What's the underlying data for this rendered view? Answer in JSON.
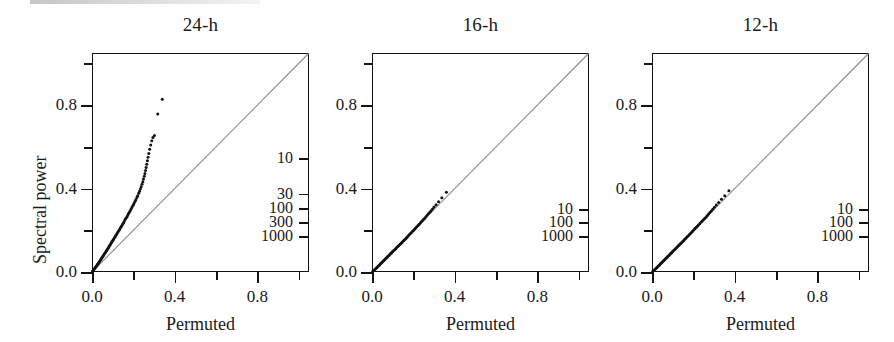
{
  "figure": {
    "axis_title_x": "Permuted",
    "axis_title_y": "Spectral power"
  },
  "chart_data": {
    "type": "scatter",
    "title": "",
    "xlabel": "Permuted",
    "ylabel": "Spectral power",
    "xlim": [
      0.0,
      1.05
    ],
    "ylim": [
      0.0,
      1.05
    ],
    "grid": false,
    "legend": "none",
    "x_ticks_major": [
      "0.0",
      "0.4",
      "0.8"
    ],
    "x_ticks_major_values": [
      0.0,
      0.4,
      0.8
    ],
    "x_ticks_minor_values": [
      0.2,
      0.6,
      1.0
    ],
    "y_ticks_major": [
      "0.0",
      "0.4",
      "0.8"
    ],
    "y_ticks_major_values": [
      0.0,
      0.4,
      0.8
    ],
    "y_ticks_minor_values": [
      0.2,
      0.6,
      1.0
    ],
    "reference_line": {
      "description": "y = x identity diagonal",
      "from": [
        0.0,
        0.0
      ],
      "to": [
        1.05,
        1.05
      ],
      "color": "#8c8c8c"
    },
    "panels": [
      {
        "title": "24-h",
        "point_color": "#111111",
        "rank_axis": {
          "side": "right",
          "labels": [
            "10",
            "30",
            "100",
            "300",
            "1000"
          ],
          "values": [
            10,
            30,
            100,
            300,
            1000
          ],
          "y_positions": [
            0.545,
            0.375,
            0.307,
            0.24,
            0.172
          ]
        },
        "points": [
          [
            0.003,
            0.004
          ],
          [
            0.006,
            0.008
          ],
          [
            0.009,
            0.012
          ],
          [
            0.012,
            0.016
          ],
          [
            0.015,
            0.02
          ],
          [
            0.018,
            0.024
          ],
          [
            0.021,
            0.028
          ],
          [
            0.024,
            0.032
          ],
          [
            0.027,
            0.037
          ],
          [
            0.03,
            0.041
          ],
          [
            0.033,
            0.045
          ],
          [
            0.036,
            0.05
          ],
          [
            0.039,
            0.054
          ],
          [
            0.042,
            0.059
          ],
          [
            0.045,
            0.063
          ],
          [
            0.048,
            0.068
          ],
          [
            0.051,
            0.073
          ],
          [
            0.054,
            0.077
          ],
          [
            0.057,
            0.082
          ],
          [
            0.06,
            0.087
          ],
          [
            0.064,
            0.092
          ],
          [
            0.067,
            0.097
          ],
          [
            0.07,
            0.102
          ],
          [
            0.073,
            0.107
          ],
          [
            0.077,
            0.113
          ],
          [
            0.08,
            0.118
          ],
          [
            0.083,
            0.123
          ],
          [
            0.087,
            0.129
          ],
          [
            0.09,
            0.134
          ],
          [
            0.094,
            0.14
          ],
          [
            0.097,
            0.146
          ],
          [
            0.101,
            0.151
          ],
          [
            0.104,
            0.157
          ],
          [
            0.108,
            0.163
          ],
          [
            0.112,
            0.169
          ],
          [
            0.115,
            0.175
          ],
          [
            0.119,
            0.181
          ],
          [
            0.123,
            0.188
          ],
          [
            0.127,
            0.194
          ],
          [
            0.131,
            0.2
          ],
          [
            0.135,
            0.207
          ],
          [
            0.139,
            0.214
          ],
          [
            0.143,
            0.22
          ],
          [
            0.147,
            0.227
          ],
          [
            0.151,
            0.234
          ],
          [
            0.155,
            0.241
          ],
          [
            0.159,
            0.249
          ],
          [
            0.163,
            0.256
          ],
          [
            0.168,
            0.263
          ],
          [
            0.172,
            0.271
          ],
          [
            0.176,
            0.279
          ],
          [
            0.181,
            0.287
          ],
          [
            0.185,
            0.295
          ],
          [
            0.19,
            0.303
          ],
          [
            0.194,
            0.312
          ],
          [
            0.199,
            0.32
          ],
          [
            0.203,
            0.329
          ],
          [
            0.208,
            0.338
          ],
          [
            0.212,
            0.347
          ],
          [
            0.217,
            0.357
          ],
          [
            0.221,
            0.366
          ],
          [
            0.226,
            0.377
          ],
          [
            0.23,
            0.387
          ],
          [
            0.234,
            0.398
          ],
          [
            0.238,
            0.409
          ],
          [
            0.242,
            0.421
          ],
          [
            0.246,
            0.433
          ],
          [
            0.249,
            0.446
          ],
          [
            0.253,
            0.459
          ],
          [
            0.256,
            0.472
          ],
          [
            0.259,
            0.487
          ],
          [
            0.262,
            0.501
          ],
          [
            0.265,
            0.517
          ],
          [
            0.268,
            0.533
          ],
          [
            0.271,
            0.55
          ],
          [
            0.275,
            0.568
          ],
          [
            0.279,
            0.588
          ],
          [
            0.284,
            0.609
          ],
          [
            0.289,
            0.629
          ],
          [
            0.295,
            0.645
          ],
          [
            0.302,
            0.655
          ],
          [
            0.318,
            0.757
          ],
          [
            0.34,
            0.828
          ]
        ]
      },
      {
        "title": "16-h",
        "point_color": "#111111",
        "rank_axis": {
          "side": "right",
          "labels": [
            "10",
            "100",
            "1000"
          ],
          "values": [
            10,
            100,
            1000
          ],
          "y_positions": [
            0.302,
            0.238,
            0.173
          ]
        },
        "points": [
          [
            0.004,
            0.003
          ],
          [
            0.008,
            0.007
          ],
          [
            0.012,
            0.011
          ],
          [
            0.016,
            0.014
          ],
          [
            0.02,
            0.018
          ],
          [
            0.024,
            0.022
          ],
          [
            0.028,
            0.026
          ],
          [
            0.032,
            0.03
          ],
          [
            0.036,
            0.034
          ],
          [
            0.04,
            0.038
          ],
          [
            0.044,
            0.042
          ],
          [
            0.048,
            0.046
          ],
          [
            0.052,
            0.05
          ],
          [
            0.056,
            0.054
          ],
          [
            0.06,
            0.058
          ],
          [
            0.064,
            0.062
          ],
          [
            0.068,
            0.066
          ],
          [
            0.072,
            0.07
          ],
          [
            0.076,
            0.074
          ],
          [
            0.08,
            0.078
          ],
          [
            0.084,
            0.082
          ],
          [
            0.088,
            0.086
          ],
          [
            0.092,
            0.09
          ],
          [
            0.096,
            0.094
          ],
          [
            0.1,
            0.098
          ],
          [
            0.105,
            0.103
          ],
          [
            0.11,
            0.107
          ],
          [
            0.115,
            0.112
          ],
          [
            0.12,
            0.117
          ],
          [
            0.125,
            0.122
          ],
          [
            0.13,
            0.127
          ],
          [
            0.135,
            0.132
          ],
          [
            0.14,
            0.137
          ],
          [
            0.145,
            0.142
          ],
          [
            0.15,
            0.147
          ],
          [
            0.155,
            0.152
          ],
          [
            0.16,
            0.157
          ],
          [
            0.165,
            0.162
          ],
          [
            0.17,
            0.168
          ],
          [
            0.175,
            0.173
          ],
          [
            0.18,
            0.178
          ],
          [
            0.186,
            0.184
          ],
          [
            0.191,
            0.189
          ],
          [
            0.196,
            0.195
          ],
          [
            0.201,
            0.2
          ],
          [
            0.207,
            0.206
          ],
          [
            0.212,
            0.212
          ],
          [
            0.217,
            0.217
          ],
          [
            0.223,
            0.223
          ],
          [
            0.228,
            0.229
          ],
          [
            0.234,
            0.235
          ],
          [
            0.239,
            0.241
          ],
          [
            0.245,
            0.247
          ],
          [
            0.25,
            0.253
          ],
          [
            0.256,
            0.259
          ],
          [
            0.262,
            0.266
          ],
          [
            0.268,
            0.273
          ],
          [
            0.274,
            0.28
          ],
          [
            0.28,
            0.287
          ],
          [
            0.286,
            0.294
          ],
          [
            0.293,
            0.302
          ],
          [
            0.3,
            0.312
          ],
          [
            0.31,
            0.323
          ],
          [
            0.322,
            0.337
          ],
          [
            0.338,
            0.356
          ],
          [
            0.36,
            0.382
          ]
        ]
      },
      {
        "title": "12-h",
        "point_color": "#111111",
        "rank_axis": {
          "side": "right",
          "labels": [
            "10",
            "100",
            "1000"
          ],
          "values": [
            10,
            100,
            1000
          ],
          "y_positions": [
            0.302,
            0.238,
            0.173
          ]
        },
        "points": [
          [
            0.004,
            0.003
          ],
          [
            0.008,
            0.007
          ],
          [
            0.012,
            0.011
          ],
          [
            0.016,
            0.014
          ],
          [
            0.02,
            0.018
          ],
          [
            0.024,
            0.022
          ],
          [
            0.028,
            0.026
          ],
          [
            0.032,
            0.03
          ],
          [
            0.036,
            0.034
          ],
          [
            0.04,
            0.038
          ],
          [
            0.044,
            0.042
          ],
          [
            0.048,
            0.046
          ],
          [
            0.052,
            0.05
          ],
          [
            0.056,
            0.054
          ],
          [
            0.06,
            0.058
          ],
          [
            0.064,
            0.062
          ],
          [
            0.068,
            0.066
          ],
          [
            0.072,
            0.07
          ],
          [
            0.076,
            0.074
          ],
          [
            0.08,
            0.078
          ],
          [
            0.084,
            0.082
          ],
          [
            0.088,
            0.086
          ],
          [
            0.092,
            0.09
          ],
          [
            0.096,
            0.094
          ],
          [
            0.1,
            0.098
          ],
          [
            0.105,
            0.103
          ],
          [
            0.11,
            0.108
          ],
          [
            0.115,
            0.113
          ],
          [
            0.12,
            0.118
          ],
          [
            0.125,
            0.123
          ],
          [
            0.13,
            0.128
          ],
          [
            0.135,
            0.133
          ],
          [
            0.14,
            0.138
          ],
          [
            0.145,
            0.143
          ],
          [
            0.15,
            0.148
          ],
          [
            0.155,
            0.153
          ],
          [
            0.16,
            0.158
          ],
          [
            0.165,
            0.163
          ],
          [
            0.17,
            0.169
          ],
          [
            0.176,
            0.174
          ],
          [
            0.181,
            0.18
          ],
          [
            0.186,
            0.185
          ],
          [
            0.192,
            0.191
          ],
          [
            0.197,
            0.196
          ],
          [
            0.203,
            0.202
          ],
          [
            0.208,
            0.208
          ],
          [
            0.214,
            0.214
          ],
          [
            0.219,
            0.219
          ],
          [
            0.225,
            0.225
          ],
          [
            0.231,
            0.231
          ],
          [
            0.237,
            0.238
          ],
          [
            0.243,
            0.244
          ],
          [
            0.249,
            0.25
          ],
          [
            0.255,
            0.257
          ],
          [
            0.261,
            0.263
          ],
          [
            0.267,
            0.27
          ],
          [
            0.273,
            0.277
          ],
          [
            0.28,
            0.285
          ],
          [
            0.287,
            0.293
          ],
          [
            0.294,
            0.301
          ],
          [
            0.302,
            0.31
          ],
          [
            0.311,
            0.321
          ],
          [
            0.322,
            0.333
          ],
          [
            0.336,
            0.349
          ],
          [
            0.352,
            0.366
          ],
          [
            0.372,
            0.389
          ]
        ]
      }
    ]
  }
}
